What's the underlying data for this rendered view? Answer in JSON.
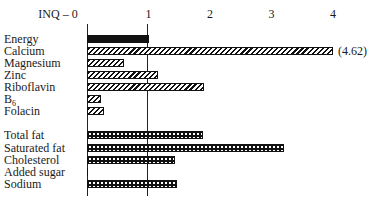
{
  "chart_data": {
    "type": "bar",
    "orientation": "horizontal",
    "title": "",
    "xlabel": "INQ",
    "ylabel": "",
    "axis_label_prefix": "INQ – 0",
    "xticks": [
      0,
      1,
      2,
      3,
      4
    ],
    "xtick_labels": [
      "INQ – 0",
      "1",
      "2",
      "3",
      "4"
    ],
    "xlim": [
      0,
      4.1
    ],
    "grid": false,
    "reference_lines": [
      0,
      1
    ],
    "legend": null,
    "groups": [
      {
        "name": "nutrients",
        "pattern": "hatched",
        "categories": [
          "Energy",
          "Calcium",
          "Magnesium",
          "Zinc",
          "Riboflavin",
          "B6",
          "Folacin"
        ],
        "values": [
          1.0,
          4.62,
          0.6,
          1.15,
          1.9,
          0.22,
          0.27
        ]
      },
      {
        "name": "constituents",
        "pattern": "dotted",
        "categories": [
          "Total fat",
          "Saturated fat",
          "Cholesterol",
          "Added sugar",
          "Sodium"
        ],
        "values": [
          1.88,
          3.2,
          1.43,
          0.0,
          1.47
        ]
      }
    ],
    "annotations": [
      {
        "category": "Calcium",
        "text": "(4.62)",
        "note": "bar truncated at axis max"
      }
    ],
    "categories": [
      "Energy",
      "Calcium",
      "Magnesium",
      "Zinc",
      "Riboflavin",
      "B6",
      "Folacin",
      "Total fat",
      "Saturated fat",
      "Cholesterol",
      "Added sugar",
      "Sodium"
    ],
    "values": [
      1.0,
      4.62,
      0.6,
      1.15,
      1.9,
      0.22,
      0.27,
      1.88,
      3.2,
      1.43,
      0.0,
      1.47
    ]
  },
  "rows": [
    {
      "label": "Energy",
      "sub": "",
      "value": 1.0,
      "style": "solid",
      "y": 33
    },
    {
      "label": "Calcium",
      "sub": "",
      "value": 4.62,
      "style": "hatch",
      "y": 45,
      "annot": "(4.62)",
      "cap": 4.0
    },
    {
      "label": "Magnesium",
      "sub": "",
      "value": 0.6,
      "style": "hatch",
      "y": 57
    },
    {
      "label": "Zinc",
      "sub": "",
      "value": 1.15,
      "style": "hatch",
      "y": 69
    },
    {
      "label": "Riboflavin",
      "sub": "",
      "value": 1.9,
      "style": "hatch",
      "y": 81
    },
    {
      "label": "B",
      "sub": "6",
      "value": 0.22,
      "style": "hatch",
      "y": 93
    },
    {
      "label": "Folacin",
      "sub": "",
      "value": 0.27,
      "style": "hatch",
      "y": 105
    },
    {
      "label": "Total fat",
      "sub": "",
      "value": 1.88,
      "style": "dots",
      "y": 129
    },
    {
      "label": "Saturated fat",
      "sub": "",
      "value": 3.2,
      "style": "dots",
      "y": 142
    },
    {
      "label": "Cholesterol",
      "sub": "",
      "value": 1.43,
      "style": "dots",
      "y": 154
    },
    {
      "label": "Added sugar",
      "sub": "",
      "value": 0.0,
      "style": "dots",
      "y": 166
    },
    {
      "label": "Sodium",
      "sub": "",
      "value": 1.47,
      "style": "dots",
      "y": 178
    }
  ],
  "axis": {
    "origin_label": "INQ – 0",
    "ticks": [
      {
        "label": "1",
        "value": 1
      },
      {
        "label": "2",
        "value": 2
      },
      {
        "label": "3",
        "value": 3
      },
      {
        "label": "4",
        "value": 4
      }
    ]
  }
}
